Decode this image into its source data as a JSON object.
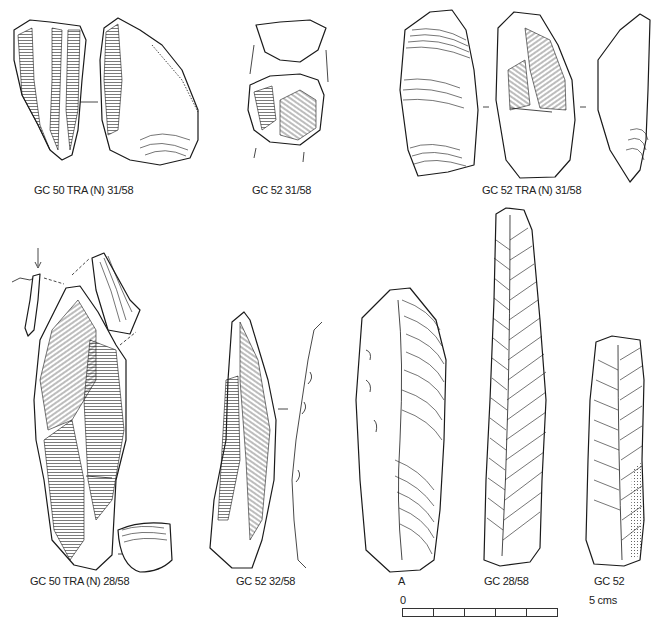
{
  "figure": {
    "artifacts": [
      {
        "id": "a1",
        "label": "GC 50 TRA (N) 31/58"
      },
      {
        "id": "a2",
        "label": "GC 52 31/58"
      },
      {
        "id": "a3",
        "label": "GC 52 TRA (N) 31/58"
      },
      {
        "id": "a4",
        "label": "GC 50 TRA (N) 28/58"
      },
      {
        "id": "a5",
        "label": "GC 52 32/58"
      },
      {
        "id": "a6",
        "label": "A"
      },
      {
        "id": "a7",
        "label": "GC 28/58"
      },
      {
        "id": "a8",
        "label": "GC 52"
      }
    ],
    "scale": {
      "start_label": "0",
      "end_label": "5 cms",
      "segments": 5
    }
  }
}
